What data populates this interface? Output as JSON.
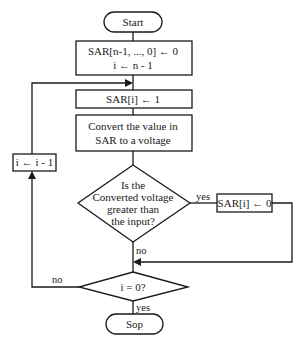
{
  "flowchart": {
    "start": "Start",
    "init": {
      "line1": "SAR[n-1, ..., 0] ← 0",
      "line2": "i ← n - 1"
    },
    "set_bit": "SAR[i] ← 1",
    "convert": {
      "line1": "Convert the value in",
      "line2": "SAR to a voltage"
    },
    "compare": {
      "line1": "Is the",
      "line2": "Converted voltage",
      "line3": "greater than",
      "line4": "the input?"
    },
    "clear_bit": "SAR[i] ← 0",
    "decrement": "i ← i - 1",
    "check_zero": "i = 0?",
    "stop": "Sop",
    "edge_labels": {
      "compare_yes": "yes",
      "compare_no": "no",
      "check_no": "no",
      "check_yes": "yes"
    }
  }
}
